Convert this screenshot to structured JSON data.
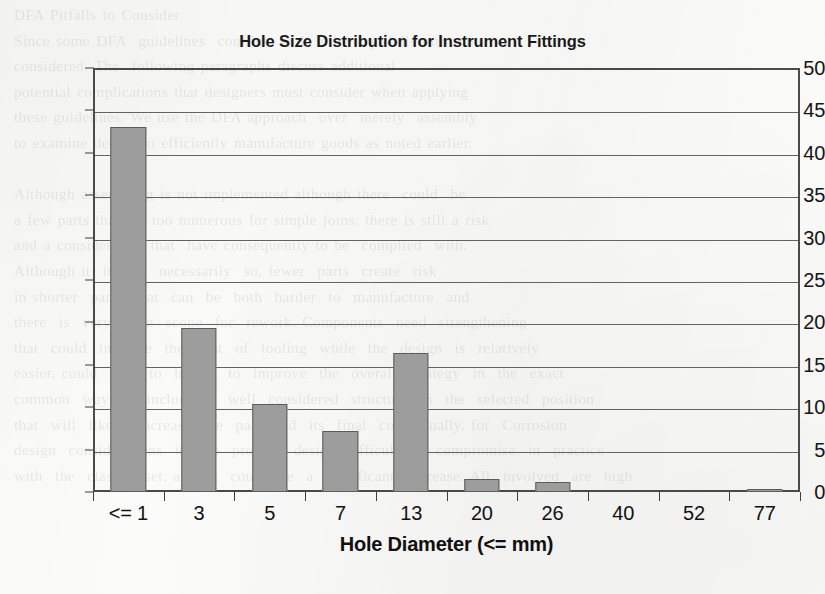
{
  "chart_data": {
    "type": "bar",
    "title": "Hole Size Distribution for Instrument Fittings",
    "xlabel": "Hole Diameter (<= mm)",
    "ylabel": "Percentage",
    "categories": [
      "<= 1",
      "3",
      "5",
      "7",
      "13",
      "20",
      "26",
      "40",
      "52",
      "77"
    ],
    "values": [
      43.0,
      19.4,
      10.4,
      7.2,
      16.4,
      1.5,
      1.2,
      0,
      0,
      0.3
    ],
    "ylim": [
      0,
      50
    ],
    "ytick_labels": [
      "50",
      "45",
      "40",
      "35",
      "30",
      "25",
      "20",
      "15",
      "10",
      "5",
      "0"
    ],
    "ytick_values": [
      50,
      45,
      40,
      35,
      30,
      25,
      20,
      15,
      10,
      5,
      0
    ],
    "grid": true,
    "legend": false,
    "series_color": "#9d9d9d",
    "series_border_color": "#5c5c5c",
    "axis_color": "#4a4a4a"
  },
  "background_text": "DFA Pitfalls to Consider\nSince some DFA  guidelines  conflict  with  others, pitfalls must  be\nconsidered. The  following paragraphs discuss additional\npotential complications that designers must consider when applying\nthese guidelines. We use the DFA approach  over  merely  assembly\nto examine details to efficiently manufacture goods as noted earlier.\n\nAlthough assembling is not implemented although there  could  be\na few parts that are too numerous for simple joins, there is still a risk\nand a consideration that  have consequently to be  complied  with.\nAlthough it  is  not  necessarily  so, fewer  parts  create  risk\nin shorter  parts  that  can  be  both  harder  to  manufacture  and\nthere  is  very  little  scope  for  rework. Components  need  strengthening\nthat  could  increase  the  cost  of  tooling  while  the  design  is  relatively\neasier, could  lead  to  harder  to  improve  the  overall  strategy  in  the  exact\ncommon  way  to  include  it  well  considered  structure  in  the  selected  position\nthat  will  likely  increase  the  part  and  its  final  cost. Finally, for  Corrosion\ndesign  considerations  in  the  product  design, difficult  to  compromise  in  practice\nwith  the  classes  set, and  it  could  be  a  significant  increase. All  involved  are  high"
}
